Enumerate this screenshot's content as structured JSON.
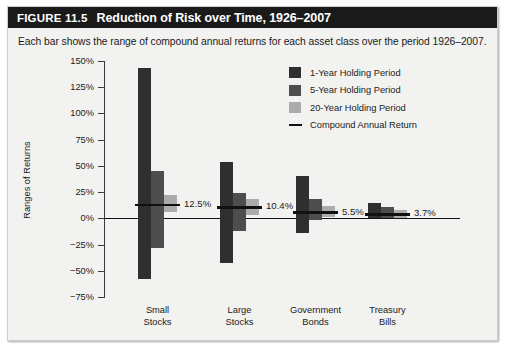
{
  "figure": {
    "number": "FIGURE 11.5",
    "title": "Reduction of Risk over Time, 1926–2007",
    "caption": "Each bar shows the range of compound annual returns for each asset class over the period 1926–2007."
  },
  "legend": {
    "items": [
      {
        "label": "1-Year Holding Period",
        "color": "#2f2f2f",
        "type": "swatch"
      },
      {
        "label": "5-Year Holding Period",
        "color": "#4e4e4e",
        "type": "swatch"
      },
      {
        "label": "20-Year Holding Period",
        "color": "#ababab",
        "type": "swatch"
      },
      {
        "label": "Compound Annual Return",
        "color": "#111111",
        "type": "line"
      }
    ]
  },
  "chart_data": {
    "type": "bar",
    "title": "Reduction of Risk over Time, 1926–2007",
    "subtitle": "Each bar shows the range of compound annual returns for each asset class over the period 1926–2007.",
    "xlabel": "",
    "ylabel": "Ranges of Returns",
    "ylim": [
      -75,
      150
    ],
    "ytick_values": [
      150,
      125,
      100,
      75,
      50,
      25,
      0,
      -25,
      -50,
      -75
    ],
    "ytick_labels": [
      "150%",
      "125%",
      "100%",
      "75%",
      "50%",
      "25%",
      "0%",
      "−25%",
      "−50%",
      "−75%"
    ],
    "grid": false,
    "legend_position": "upper right",
    "value_unit": "percent",
    "categories": [
      "Small\nStocks",
      "Large\nStocks",
      "Government\nBonds",
      "Treasury\nBills"
    ],
    "series": [
      {
        "name": "1-Year Holding Period",
        "color": "#2f2f2f",
        "ranges": [
          {
            "category": "Small Stocks",
            "low": -58.0,
            "high": 143.0
          },
          {
            "category": "Large Stocks",
            "low": -43.0,
            "high": 54.0
          },
          {
            "category": "Government Bonds",
            "low": -14.0,
            "high": 40.0
          },
          {
            "category": "Treasury Bills",
            "low": 0.0,
            "high": 15.0
          }
        ]
      },
      {
        "name": "5-Year Holding Period",
        "color": "#4e4e4e",
        "ranges": [
          {
            "category": "Small Stocks",
            "low": -28.0,
            "high": 45.0
          },
          {
            "category": "Large Stocks",
            "low": -12.0,
            "high": 24.0
          },
          {
            "category": "Government Bonds",
            "low": -2.0,
            "high": 18.0
          },
          {
            "category": "Treasury Bills",
            "low": 0.5,
            "high": 11.0
          }
        ]
      },
      {
        "name": "20-Year Holding Period",
        "color": "#ababab",
        "ranges": [
          {
            "category": "Small Stocks",
            "low": 6.0,
            "high": 22.0
          },
          {
            "category": "Large Stocks",
            "low": 3.0,
            "high": 18.0
          },
          {
            "category": "Government Bonds",
            "low": 1.0,
            "high": 12.0
          },
          {
            "category": "Treasury Bills",
            "low": 0.5,
            "high": 8.0
          }
        ]
      }
    ],
    "compound_annual_return": [
      {
        "category": "Small Stocks",
        "value": 12.5,
        "label": "12.5%"
      },
      {
        "category": "Large Stocks",
        "value": 10.4,
        "label": "10.4%"
      },
      {
        "category": "Government Bonds",
        "value": 5.5,
        "label": "5.5%"
      },
      {
        "category": "Treasury Bills",
        "value": 3.7,
        "label": "3.7%"
      }
    ]
  }
}
